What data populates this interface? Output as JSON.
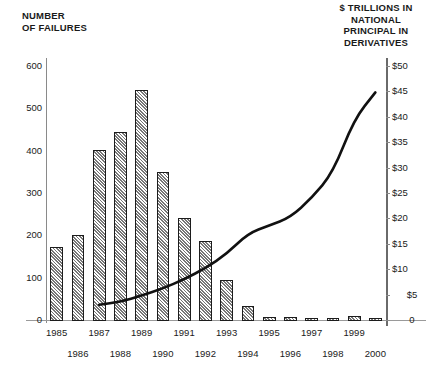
{
  "axes": {
    "left_title": "NUMBER\nOF FAILURES",
    "right_title": "$ TRILLIONS IN\nNATIONAL\nPRINCIPAL IN\nDERIVATIVES",
    "left_ticks": [
      "600",
      "500",
      "400",
      "300",
      "200",
      "100",
      "0"
    ],
    "right_ticks": [
      "$50",
      "$45",
      "$40",
      "$35",
      "$30",
      "$25",
      "$20",
      "$15",
      "$10",
      "$5",
      "0"
    ]
  },
  "xaxis": {
    "labels": [
      "1985",
      "1986",
      "1987",
      "1988",
      "1989",
      "1990",
      "1991",
      "1992",
      "1993",
      "1994",
      "1995",
      "1996",
      "1997",
      "1998",
      "1999",
      "2000"
    ]
  },
  "colors": {
    "bar_outline": "#1c1c1c",
    "bar_fill": "#d8d8d8",
    "line": "#111111",
    "axis": "#8a8a8a",
    "text": "#1a1a1a"
  },
  "chart_data": {
    "type": "bar",
    "title": "",
    "subtitle": "",
    "xlabel": "",
    "ylabel": "NUMBER OF FAILURES",
    "y2label": "$ TRILLIONS IN NATIONAL PRINCIPAL IN DERIVATIVES",
    "categories": [
      "1985",
      "1986",
      "1987",
      "1988",
      "1989",
      "1990",
      "1991",
      "1992",
      "1993",
      "1994",
      "1995",
      "1996",
      "1997",
      "1998",
      "1999",
      "2000"
    ],
    "ylim": [
      0,
      600
    ],
    "y2lim": [
      0,
      50
    ],
    "yticks": [
      0,
      100,
      200,
      300,
      400,
      500,
      600
    ],
    "y2ticks": [
      0,
      5,
      10,
      15,
      20,
      25,
      30,
      35,
      40,
      45,
      50
    ],
    "grid": false,
    "legend": "none",
    "series": [
      {
        "name": "Number of failures",
        "type": "bar",
        "axis": "left",
        "values": [
          175,
          203,
          405,
          447,
          545,
          352,
          243,
          190,
          97,
          35,
          10,
          10,
          2,
          4,
          12,
          3
        ]
      },
      {
        "name": "National principal in derivatives",
        "type": "line",
        "axis": "right",
        "x": [
          "1987",
          "1988",
          "1989",
          "1990",
          "1991",
          "1992",
          "1993",
          "1994",
          "1995",
          "1996",
          "1997",
          "1998",
          "1999",
          "2000"
        ],
        "values": [
          3.0,
          3.6,
          4.8,
          6.2,
          8.0,
          10.2,
          13.0,
          17.0,
          18.6,
          20.2,
          24.0,
          29.0,
          39.5,
          44.8
        ]
      }
    ]
  }
}
